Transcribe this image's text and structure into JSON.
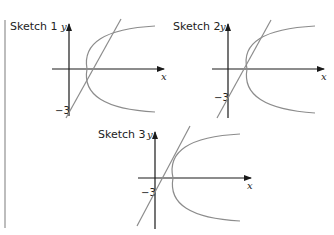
{
  "sketches": [
    {
      "title": "Sketch 1",
      "x_label": "x",
      "y_label": "y",
      "y_intercept_label": "−3",
      "description": "Line with y-intercept -3 crosses a rightward-opening parabola at two points"
    },
    {
      "title": "Sketch 2",
      "x_label": "x",
      "y_label": "y",
      "y_intercept_label": "−3",
      "description": "Line with y-intercept -3 is tangent to a rightward-opening parabola (one point)"
    },
    {
      "title": "Sketch 3",
      "x_label": "x",
      "y_label": "y",
      "y_intercept_label": "−3",
      "description": "Line with y-intercept -3 does not intersect a rightward-opening parabola"
    }
  ],
  "colors": {
    "axes": "#1a1a1a",
    "curves": "#8c8c8c",
    "rule": "#bdbdbd"
  }
}
